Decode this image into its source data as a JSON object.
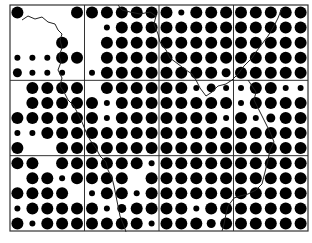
{
  "map": {
    "type": "dot-density-grid",
    "frame": {
      "x": 10,
      "y": 5,
      "width": 298,
      "height": 226
    },
    "cells": {
      "cols": 4,
      "rows": 3
    },
    "dots_per_cell": {
      "cols": 5,
      "rows": 5
    },
    "colors": {
      "dot": "#000000",
      "grid": "#333333",
      "boundary": "#222222",
      "background": "#ffffff"
    },
    "dot_radius_by_size": {
      "0": 0,
      "1": 3,
      "2": 4.5,
      "3": 6
    },
    "dot_grid": [
      [
        3,
        0,
        0,
        0,
        3,
        3,
        3,
        3,
        3,
        3,
        3,
        1,
        3,
        3,
        3,
        3,
        3,
        3,
        3,
        3
      ],
      [
        0,
        0,
        0,
        0,
        0,
        0,
        1,
        3,
        3,
        3,
        3,
        3,
        3,
        3,
        3,
        3,
        3,
        3,
        3,
        3
      ],
      [
        0,
        0,
        0,
        3,
        0,
        0,
        3,
        3,
        3,
        3,
        3,
        3,
        3,
        3,
        3,
        3,
        3,
        3,
        3,
        3
      ],
      [
        1,
        1,
        1,
        3,
        3,
        0,
        3,
        3,
        3,
        3,
        3,
        3,
        3,
        3,
        3,
        3,
        3,
        3,
        3,
        3
      ],
      [
        2,
        1,
        1,
        1,
        0,
        1,
        3,
        3,
        3,
        3,
        3,
        3,
        3,
        3,
        2,
        3,
        3,
        3,
        3,
        3
      ],
      [
        0,
        3,
        3,
        3,
        3,
        0,
        3,
        3,
        3,
        3,
        3,
        3,
        1,
        2,
        1,
        1,
        3,
        3,
        1,
        1
      ],
      [
        0,
        3,
        3,
        3,
        3,
        3,
        1,
        3,
        3,
        3,
        3,
        3,
        3,
        3,
        3,
        1,
        3,
        3,
        3,
        3
      ],
      [
        3,
        3,
        3,
        3,
        3,
        3,
        1,
        3,
        3,
        3,
        3,
        3,
        3,
        3,
        1,
        3,
        1,
        2,
        3,
        3
      ],
      [
        1,
        1,
        3,
        3,
        3,
        3,
        3,
        3,
        3,
        3,
        3,
        3,
        3,
        3,
        3,
        3,
        3,
        3,
        3,
        3
      ],
      [
        3,
        0,
        0,
        3,
        3,
        3,
        3,
        3,
        3,
        3,
        3,
        3,
        3,
        3,
        3,
        3,
        3,
        3,
        3,
        3
      ],
      [
        3,
        3,
        0,
        3,
        3,
        3,
        3,
        3,
        3,
        1,
        3,
        3,
        3,
        3,
        3,
        3,
        3,
        3,
        3,
        3
      ],
      [
        0,
        3,
        3,
        1,
        3,
        3,
        3,
        3,
        0,
        3,
        3,
        3,
        3,
        3,
        3,
        3,
        3,
        3,
        3,
        3
      ],
      [
        3,
        3,
        3,
        3,
        0,
        1,
        3,
        3,
        1,
        3,
        3,
        3,
        3,
        3,
        3,
        3,
        3,
        3,
        3,
        3
      ],
      [
        1,
        3,
        3,
        3,
        3,
        3,
        1,
        2,
        3,
        3,
        3,
        3,
        1,
        3,
        3,
        3,
        3,
        3,
        3,
        3
      ],
      [
        3,
        1,
        3,
        3,
        3,
        3,
        3,
        3,
        3,
        1,
        3,
        3,
        3,
        2,
        3,
        3,
        3,
        3,
        3,
        3
      ]
    ],
    "boundaries": [
      {
        "name": "boundary-line-west",
        "points": "22,20 28,16 35,19 42,17 48,22 55,24 58,30 62,34 60,40 62,48 59,56 61,62 58,70 62,78 60,86 64,92 68,100 74,106 78,114 82,122 86,132 90,140 96,148 100,156 106,162 108,170 112,178 114,186 116,196 118,206 120,216 124,226 126,232"
      },
      {
        "name": "boundary-line-north",
        "points": "118,5 122,10 130,12 140,14 150,12 156,16 154,24 158,34 160,42 166,50 170,58 178,64 186,70 192,74 196,80 200,88 206,96 212,92 218,86 226,84 232,80 238,74 244,66 252,58 256,52 262,44 268,36 274,26 278,18 282,8"
      },
      {
        "name": "boundary-line-east",
        "points": "248,80 252,86 256,92 254,100 258,108 262,116 266,124 270,132 274,142 270,150 268,160 266,168 264,176 262,184 256,190 248,194 240,196 234,198 228,206 226,214 224,224 222,231"
      }
    ]
  }
}
